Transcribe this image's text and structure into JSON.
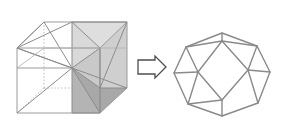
{
  "figure": {
    "title": "Cube dissection transforming into a rhombic dodecahedron",
    "caption": "",
    "background_color": "#ffffff",
    "width": 286,
    "height": 128
  },
  "colors": {
    "cube_edge_visible": "#9a9a9a",
    "cube_edge_hidden": "#b8b8b8",
    "pyramid_edge": "#8c8c8c",
    "face_light": "#d9d9d9",
    "face_mid": "#c4c4c4",
    "face_dark": "#a8a8a8",
    "arrow_stroke": "#4d4d4d",
    "arrow_fill": "#ffffff",
    "dodecahedron_edge": "#8a8a8a"
  },
  "left_figure": {
    "name": "cube-with-inscribed-pyramids",
    "label": "",
    "cube": {
      "front_top_left": [
        17,
        48
      ],
      "front_top_right": [
        100,
        48
      ],
      "front_bottom_left": [
        17,
        113
      ],
      "front_bottom_right": [
        100,
        113
      ],
      "back_top_left": [
        44,
        22
      ],
      "back_top_right": [
        127,
        22
      ],
      "back_bottom_left": [
        44,
        88
      ],
      "back_bottom_right": [
        127,
        88
      ],
      "visible_edges": 9,
      "hidden_edges": 3
    },
    "center_point": [
      72,
      68
    ],
    "shaded_faces": [
      {
        "id": "face-upper-light",
        "tone": "light"
      },
      {
        "id": "face-upper-right-mid",
        "tone": "mid"
      },
      {
        "id": "face-lower-dark",
        "tone": "dark"
      },
      {
        "id": "face-right-mid",
        "tone": "mid"
      }
    ]
  },
  "arrow": {
    "name": "transformation-arrow",
    "direction": "right",
    "label": "",
    "x": 138,
    "y": 56,
    "width": 28,
    "height": 22
  },
  "right_figure": {
    "name": "rhombic-dodecahedron",
    "label": "",
    "outer_vertices": {
      "top": [
        222,
        33
      ],
      "upper_left": [
        186,
        47
      ],
      "left": [
        174,
        73
      ],
      "lower_left": [
        188,
        104
      ],
      "bottom": [
        222,
        116
      ],
      "lower_right": [
        258,
        103
      ],
      "right": [
        270,
        72
      ],
      "upper_right": [
        257,
        46
      ]
    },
    "inner_vertices": {
      "top": [
        222,
        41
      ],
      "left": [
        198,
        72
      ],
      "bottom": [
        222,
        100
      ],
      "right": [
        248,
        70
      ]
    },
    "face_count": 12,
    "visible_face_count": 7
  }
}
